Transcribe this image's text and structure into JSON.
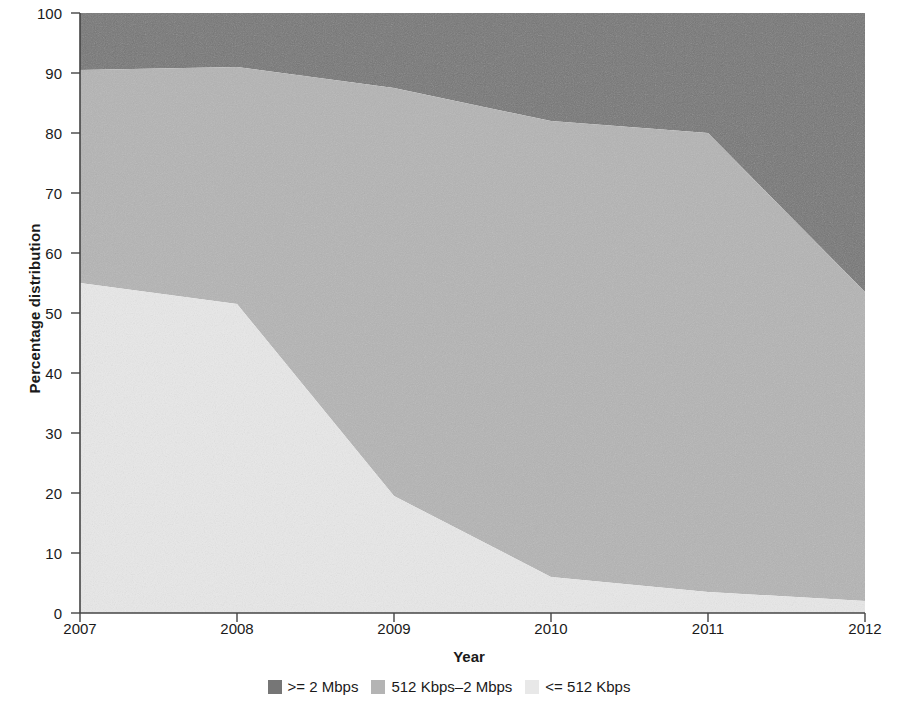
{
  "chart_data": {
    "type": "area",
    "stacked": true,
    "title": "",
    "xlabel": "Year",
    "ylabel": "Percentage distribution",
    "x": [
      2007,
      2008,
      2009,
      2010,
      2011,
      2012
    ],
    "xtick_labels": [
      "2007",
      "2008",
      "2009",
      "2010",
      "2011",
      "2012"
    ],
    "ytick_labels": [
      "0",
      "10",
      "20",
      "30",
      "40",
      "50",
      "60",
      "70",
      "80",
      "90",
      "100"
    ],
    "ytick_values": [
      0,
      10,
      20,
      30,
      40,
      50,
      60,
      70,
      80,
      90,
      100
    ],
    "ylim": [
      0,
      100
    ],
    "xlim": [
      2007,
      2012
    ],
    "grid": false,
    "legend_position": "bottom",
    "series": [
      {
        "name": "<= 512 Kbps",
        "color": "#e8e8e8",
        "values": [
          55,
          51.5,
          19.5,
          6,
          3.5,
          2
        ]
      },
      {
        "name": "512 Kbps–2 Mbps",
        "color": "#b4b4b4",
        "values": [
          35.5,
          39.5,
          68,
          76,
          76.5,
          51.5
        ]
      },
      {
        "name": ">= 2 Mbps",
        "color": "#767676",
        "values": [
          9.5,
          9,
          12.5,
          18,
          20,
          46.5
        ]
      }
    ],
    "cumulative_tops": {
      "light": [
        55,
        51.5,
        19.5,
        6,
        3.5,
        2
      ],
      "light_plus_medium": [
        90.5,
        91,
        87.5,
        82,
        80,
        53.5
      ],
      "total": [
        100,
        100,
        100,
        100,
        100,
        100
      ]
    },
    "legend": [
      {
        "label": ">= 2 Mbps",
        "color": "#767676",
        "swatch": "legend-swatch"
      },
      {
        "label": "512 Kbps–2 Mbps",
        "color": "#b4b4b4",
        "swatch": "legend-swatch"
      },
      {
        "label": "<= 512 Kbps",
        "color": "#e8e8e8",
        "swatch": "legend-swatch"
      }
    ],
    "axis_color": "#444444"
  }
}
